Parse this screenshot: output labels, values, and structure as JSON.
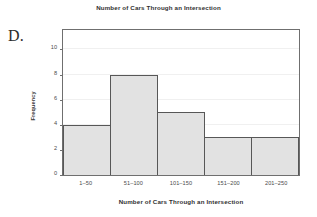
{
  "panel": {
    "letter": "D."
  },
  "chart_data": {
    "type": "bar",
    "title": "Number of Cars Through an Intersection",
    "xlabel": "Number of Cars Through an Intersection",
    "ylabel": "Frequency",
    "categories": [
      "1–50",
      "51–100",
      "101–150",
      "151–200",
      "201–250"
    ],
    "values": [
      4,
      8,
      5,
      3,
      3
    ],
    "ylim": [
      0,
      11.7
    ],
    "yticks": [
      0,
      2,
      4,
      6,
      8,
      10
    ],
    "ytick_labels": [
      "0",
      "2",
      "4",
      "6",
      "8",
      "10"
    ],
    "grid": true,
    "grid_axis": "y",
    "legend": false,
    "bar_fill_color": "#e2e2e2",
    "bar_edge_color": "#575757",
    "frame_color": "#6f6f6f",
    "gridline_color": "#f0f0f0",
    "text_color": "#2f2f2f",
    "background_color": "#ffffff"
  }
}
